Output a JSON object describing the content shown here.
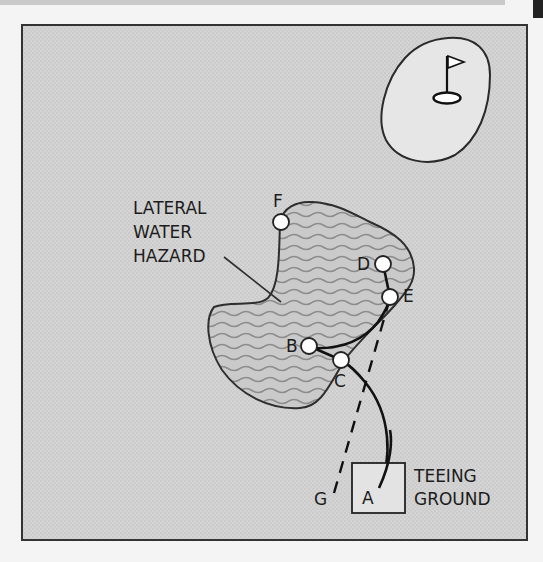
{
  "diagram": {
    "hazard_label": [
      "LATERAL",
      "WATER",
      "HAZARD"
    ],
    "teeing_label": [
      "TEEING",
      "GROUND"
    ],
    "points": {
      "A": "A",
      "B": "B",
      "C": "C",
      "D": "D",
      "E": "E",
      "F": "F",
      "G": "G"
    },
    "colors": {
      "background": "#d2d2d2",
      "green": "#e6e6e6",
      "hazard_fill": "#c6c6c6",
      "hazard_waves": "#8c8c8c",
      "line": "#1c1c1c",
      "ball": "#ffffff"
    }
  }
}
